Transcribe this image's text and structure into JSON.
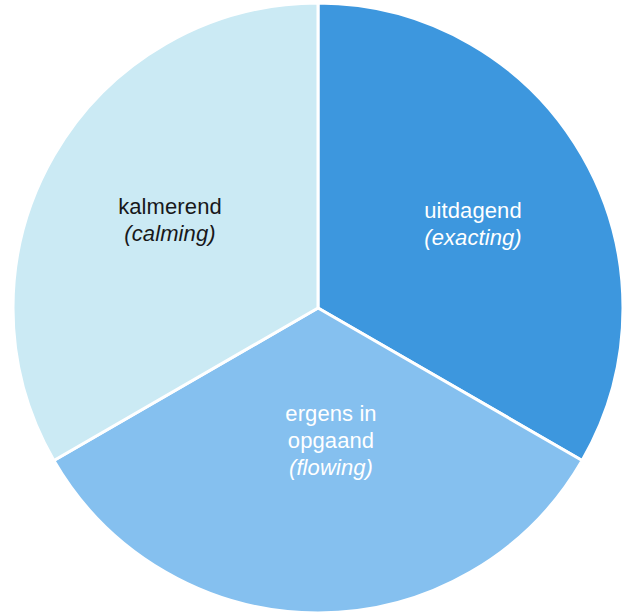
{
  "chart_data": {
    "type": "pie",
    "title": "",
    "subtitle": "",
    "xlabel": "",
    "ylabel": "",
    "legend_position": "none",
    "grid": false,
    "background_color": "#ffffff",
    "separator_color": "#ffffff",
    "total": 100,
    "categories": [
      "uitdagend",
      "ergens in opgaand",
      "kalmerend"
    ],
    "values": [
      33.3,
      33.3,
      33.3
    ],
    "slices": [
      {
        "name": "uitdagend",
        "label_primary": "uitdagend",
        "label_gloss": "(exacting)",
        "value": 33.3,
        "start_angle_deg": 0,
        "end_angle_deg": 120,
        "color": "#3d97de",
        "text_color": "#ffffff"
      },
      {
        "name": "ergens in opgaand",
        "label_primary_line1": "ergens in",
        "label_primary_line2": "opgaand",
        "label_gloss": "(flowing)",
        "value": 33.3,
        "start_angle_deg": 120,
        "end_angle_deg": 240,
        "color": "#85c0ef",
        "text_color": "#ffffff"
      },
      {
        "name": "kalmerend",
        "label_primary": "kalmerend",
        "label_gloss": "(calming)",
        "value": 33.3,
        "start_angle_deg": 240,
        "end_angle_deg": 360,
        "color": "#cbeaf4",
        "text_color": "#18181a"
      }
    ]
  },
  "labels": {
    "calming": {
      "line1": "kalmerend",
      "line2": "(calming)"
    },
    "exacting": {
      "line1": "uitdagend",
      "line2": "(exacting)"
    },
    "flowing": {
      "line1": "ergens in",
      "line2": "opgaand",
      "line3": "(flowing)"
    }
  },
  "colors": {
    "slice_exacting": "#3d97de",
    "slice_flowing": "#85c0ef",
    "slice_calming": "#cbeaf4",
    "separator": "#ffffff",
    "text_dark": "#18181a",
    "text_light": "#ffffff",
    "background": "#ffffff"
  }
}
